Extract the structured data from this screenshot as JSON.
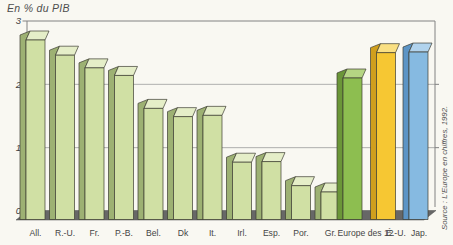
{
  "title": "En % du PIB",
  "source": "Source : L'Europe en chiffres, 1992.",
  "colors": {
    "background": "#f9f8f2",
    "grid": "#9c9c9c",
    "axis": "#828282",
    "text": "#454545",
    "tick_text": "#3f3f3f",
    "floor": "#676767",
    "outline": "#3c3c32",
    "bars": {
      "light": {
        "front": "#d0e0a4",
        "top": "#e5eec8",
        "side": "#9db173"
      },
      "europe": {
        "front": "#8dbe50",
        "top": "#b5d583",
        "side": "#6b9638"
      },
      "usa": {
        "front": "#f6c733",
        "top": "#fae083",
        "side": "#d09f1d"
      },
      "japan": {
        "front": "#86bae1",
        "top": "#b1d3ed",
        "side": "#5c94c5"
      }
    }
  },
  "chart_data": {
    "type": "bar",
    "style": "3d-oblique",
    "title": "En % du PIB",
    "ylabel": "En % du PIB",
    "xlabel": "",
    "ylim": [
      0,
      3
    ],
    "yticks": [
      0,
      1,
      2,
      3
    ],
    "grid": true,
    "categories": [
      "All.",
      "R.-U.",
      "Fr.",
      "P.-B.",
      "Bel.",
      "Dk",
      "It.",
      "Irl.",
      "Esp.",
      "Por.",
      "Gr.",
      "Europe des 12",
      "É.-U.",
      "Jap."
    ],
    "values": [
      2.7,
      2.46,
      2.26,
      2.14,
      1.62,
      1.49,
      1.51,
      0.77,
      0.78,
      0.4,
      0.3,
      2.1,
      2.5,
      2.51
    ],
    "bar_color_keys": [
      "light",
      "light",
      "light",
      "light",
      "light",
      "light",
      "light",
      "light",
      "light",
      "light",
      "light",
      "europe",
      "usa",
      "japan"
    ],
    "source": "Source : L'Europe en chiffres, 1992."
  }
}
